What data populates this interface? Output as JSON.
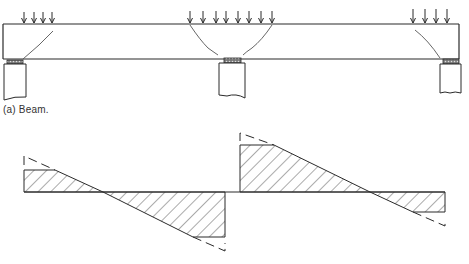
{
  "figure": {
    "caption_a": "(a)  Beam.",
    "stroke_color": "#2a2a2a",
    "hatch_color": "#444444"
  },
  "beam": {
    "x": 3,
    "y": 24,
    "width": 456,
    "height": 35,
    "supports": [
      {
        "name": "left",
        "x": 7,
        "width": 16
      },
      {
        "name": "middle",
        "x": 219,
        "width": 22
      },
      {
        "name": "right",
        "x": 441,
        "width": 17
      }
    ],
    "load_groups": [
      {
        "name": "left",
        "arrows_x": [
          24,
          34,
          43,
          52
        ]
      },
      {
        "name": "middle",
        "arrows_x": [
          190,
          203,
          216,
          226,
          238,
          249,
          261,
          272
        ]
      },
      {
        "name": "right",
        "arrows_x": [
          413,
          425,
          436,
          447
        ]
      }
    ],
    "cracks": [
      "M53,31 Q40,45 23,59",
      "M190,25 Q200,40 208,48 Q215,53 218,55",
      "M272,25 Q262,40 252,48 Q246,52 243,55",
      "M415,30 Q428,40 440,58"
    ]
  },
  "shear_diagram": {
    "baseline_y": 192,
    "segments": [
      {
        "name": "span-1",
        "polygon": "24,192 24,170 55,170 103,192 193,237 225,237 225,192"
      },
      {
        "name": "span-2",
        "polygon": "240,192 240,145 274,145 370,192 413,212 445,212 445,192"
      }
    ],
    "dashed_extensions": [
      "M24,165 L24,156 L55,170",
      "M193,237 L225,251 L225,243",
      "M240,141 L240,133 L274,145",
      "M413,212 L445,226 L445,219"
    ]
  }
}
